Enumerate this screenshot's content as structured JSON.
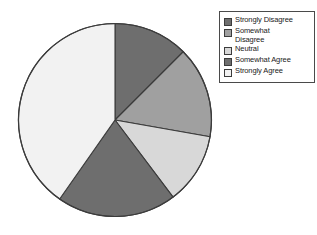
{
  "chart_data": {
    "type": "pie",
    "title": "",
    "categories": [
      "Strongly Disagree",
      "Somewhat Disagree",
      "Neutral",
      "Somewhat Agree",
      "Strongly Agree"
    ],
    "values": [
      12.5,
      15.3,
      11.9,
      20.0,
      40.3
    ],
    "angles_deg": [
      45,
      55,
      43,
      72,
      145
    ],
    "colors": [
      "#6e6e6e",
      "#a0a0a0",
      "#d8d8d8",
      "#6e6e6e",
      "#f2f2f2"
    ],
    "legend_position": "right",
    "grid": false,
    "start_angle_deg": 0,
    "direction": "clockwise",
    "xlabel": "",
    "ylabel": ""
  },
  "legend": {
    "items": [
      {
        "label": "Strongly Disagree",
        "color": "#6e6e6e",
        "name": "strongly-disagree"
      },
      {
        "label": "Somewhat\nDisagree",
        "color": "#a0a0a0",
        "name": "somewhat-disagree"
      },
      {
        "label": "Neutral",
        "color": "#d8d8d8",
        "name": "neutral"
      },
      {
        "label": "Somewhat Agree",
        "color": "#6e6e6e",
        "name": "somewhat-agree"
      },
      {
        "label": "Strongly Agree",
        "color": "#f2f2f2",
        "name": "strongly-agree"
      }
    ]
  },
  "style": {
    "outline_color": "#3c3c3c",
    "legend_border": "#4a4a4a",
    "background": "#ffffff"
  }
}
